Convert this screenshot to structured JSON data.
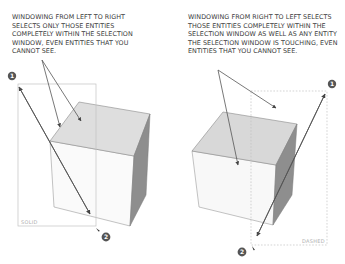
{
  "left_panel": {
    "caption": "WINDOWING FROM LEFT TO RIGHT SELECTS ONLY THOSE ENTITIES COMPLETELY WITHIN THE SELECTION WINDOW, EVEN ENTITIES THAT YOU CANNOT SEE.",
    "window_label": "SOLID",
    "start_marker": "1",
    "end_marker": "2"
  },
  "right_panel": {
    "caption": "WINDOWING FROM RIGHT TO LEFT SELECTS THOSE ENTITIES COMPLETELY WITHIN THE SELECTION WINDOW AS WELL AS ANY ENTITY THE SELECTION WINDOW IS TOUCHING, EVEN ENTITIES THAT YOU CANNOT SEE.",
    "window_label": "DASHED",
    "start_marker": "1",
    "end_marker": "2"
  },
  "colors": {
    "text": "#3a3a3a",
    "cube_top": "#dcdcdc",
    "cube_front": "#f7f7f7",
    "cube_side": "#8e8e8e",
    "window_line": "#bdbdbd",
    "arrow": "#555555",
    "marker": "#555555"
  }
}
